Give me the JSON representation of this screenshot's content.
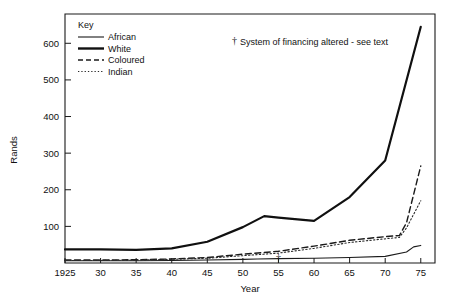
{
  "chart_data": {
    "type": "line",
    "title": "",
    "xlabel": "Year",
    "ylabel": "Rands",
    "xlim": [
      1925,
      1977
    ],
    "ylim": [
      0,
      680
    ],
    "grid": false,
    "x_ticks": [
      1925,
      1930,
      1935,
      1940,
      1945,
      1950,
      1955,
      1960,
      1965,
      1970,
      1975
    ],
    "x_tick_labels": [
      "1925",
      "30",
      "35",
      "40",
      "45",
      "50",
      "55",
      "60",
      "65",
      "70",
      "75"
    ],
    "y_ticks": [
      100,
      200,
      300,
      400,
      500,
      600
    ],
    "y_tick_labels": [
      "100",
      "200",
      "300",
      "400",
      "500",
      "600"
    ],
    "legend_position": "top-left-inside",
    "legend_title": "Key",
    "series": [
      {
        "name": "African",
        "style": "solid-thin",
        "x": [
          1925,
          1930,
          1935,
          1940,
          1945,
          1950,
          1952,
          1955,
          1960,
          1965,
          1970,
          1973,
          1974,
          1975
        ],
        "values": [
          6,
          6,
          6,
          7,
          8,
          10,
          11,
          12,
          13,
          15,
          18,
          30,
          44,
          48
        ]
      },
      {
        "name": "White",
        "style": "solid-thick",
        "x": [
          1925,
          1930,
          1935,
          1940,
          1945,
          1950,
          1953,
          1955,
          1960,
          1965,
          1970,
          1975
        ],
        "values": [
          37,
          37,
          36,
          40,
          58,
          98,
          128,
          124,
          115,
          180,
          280,
          645
        ]
      },
      {
        "name": "Coloured",
        "style": "dashed",
        "x": [
          1925,
          1930,
          1935,
          1940,
          1945,
          1950,
          1955,
          1960,
          1965,
          1970,
          1972,
          1973,
          1975
        ],
        "values": [
          8,
          8,
          9,
          11,
          15,
          24,
          32,
          46,
          62,
          72,
          75,
          110,
          265
        ]
      },
      {
        "name": "Indian",
        "style": "dotted",
        "x": [
          1925,
          1930,
          1935,
          1940,
          1945,
          1950,
          1955,
          1960,
          1965,
          1970,
          1972,
          1973,
          1975
        ],
        "values": [
          7,
          7,
          8,
          10,
          13,
          20,
          27,
          40,
          56,
          66,
          70,
          96,
          170
        ]
      }
    ],
    "annotations": [
      {
        "name": "financing-note",
        "symbol": "†",
        "text": "System of financing altered - see text",
        "x_px": 232,
        "y_px": 44
      },
      {
        "name": "financing-marker",
        "symbol": "†",
        "x_year": 1955,
        "y_value": 10
      }
    ]
  },
  "legend": {
    "title": "Key",
    "items": [
      {
        "label": "African",
        "style": "solid-thin"
      },
      {
        "label": "White",
        "style": "solid-thick"
      },
      {
        "label": "Coloured",
        "style": "dashed"
      },
      {
        "label": "Indian",
        "style": "dotted"
      }
    ]
  },
  "axes": {
    "y_title": "Rands",
    "x_title": "Year"
  },
  "colors": {
    "ink": "#1a1a1a",
    "background": "#ffffff"
  }
}
